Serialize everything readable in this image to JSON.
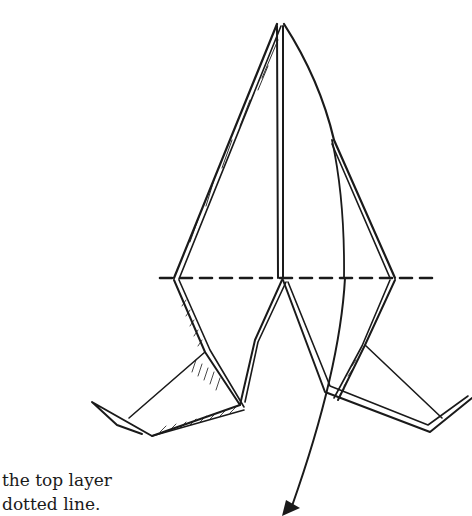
{
  "illustration": {
    "subject": "origami fold diagram",
    "fold_line_style": "dashed",
    "arrow": "fold-direction-arrow"
  },
  "caption": {
    "line1": "the top layer",
    "line2": "dotted line."
  },
  "colors": {
    "ink": "#1a1a1a",
    "paper": "#ffffff"
  }
}
